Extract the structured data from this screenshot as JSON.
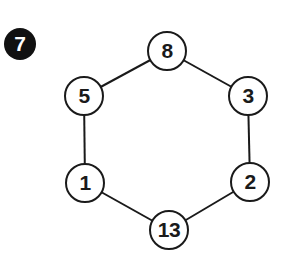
{
  "puzzle": {
    "number": "7",
    "shape": "hexagon",
    "nodes": [
      {
        "id": "top",
        "value": "8",
        "cx": 167,
        "cy": 51
      },
      {
        "id": "upper-right",
        "value": "3",
        "cx": 248,
        "cy": 96
      },
      {
        "id": "lower-right",
        "value": "2",
        "cx": 250,
        "cy": 182
      },
      {
        "id": "bottom",
        "value": "13",
        "cx": 169,
        "cy": 230
      },
      {
        "id": "lower-left",
        "value": "1",
        "cx": 85,
        "cy": 183
      },
      {
        "id": "upper-left",
        "value": "5",
        "cx": 84,
        "cy": 96
      }
    ],
    "edges": [
      [
        "top",
        "upper-right"
      ],
      [
        "upper-right",
        "lower-right"
      ],
      [
        "lower-right",
        "bottom"
      ],
      [
        "bottom",
        "lower-left"
      ],
      [
        "lower-left",
        "upper-left"
      ],
      [
        "upper-left",
        "top"
      ]
    ],
    "colors": {
      "line": "#1a1a1a",
      "badge_bg": "#111111",
      "badge_text": "#ffffff",
      "background": "#ffffff"
    }
  }
}
